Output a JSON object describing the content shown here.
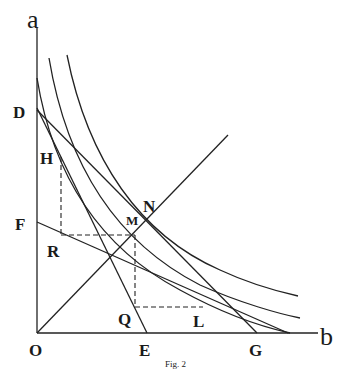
{
  "figure": {
    "caption": "Fig. 2",
    "axes": {
      "y_label": "a",
      "x_label": "b",
      "origin_label": "O"
    },
    "points": {
      "D": "D",
      "H": "H",
      "F": "F",
      "R": "R",
      "M": "M",
      "N": "N",
      "Q": "Q",
      "L": "L",
      "E": "E",
      "G": "G"
    },
    "colors": {
      "ink": "#222222",
      "background": "#ffffff"
    }
  }
}
